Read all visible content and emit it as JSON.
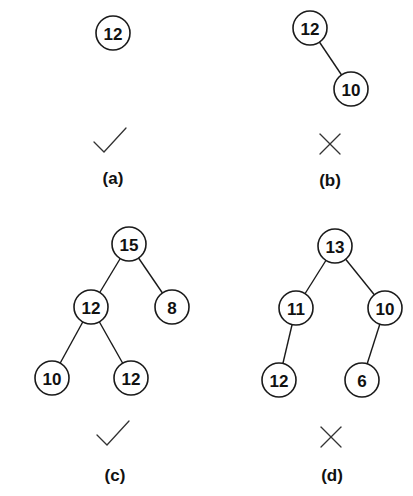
{
  "figure": {
    "node_radius": 17,
    "panels": [
      {
        "id": "a",
        "caption": "(a)",
        "caption_pos": [
          113,
          178
        ],
        "valid": true,
        "mark": "check-icon",
        "mark_pos": [
          110,
          140
        ],
        "nodes": [
          {
            "id": "a0",
            "label": "12",
            "x": 113,
            "y": 33
          }
        ],
        "edges": []
      },
      {
        "id": "b",
        "caption": "(b)",
        "caption_pos": [
          330,
          180
        ],
        "valid": false,
        "mark": "cross-icon",
        "mark_pos": [
          330,
          144
        ],
        "nodes": [
          {
            "id": "b0",
            "label": "12",
            "x": 310,
            "y": 28
          },
          {
            "id": "b1",
            "label": "10",
            "x": 351,
            "y": 89
          }
        ],
        "edges": [
          [
            "b0",
            "b1"
          ]
        ]
      },
      {
        "id": "c",
        "caption": "(c)",
        "caption_pos": [
          115,
          475
        ],
        "valid": true,
        "mark": "check-icon",
        "mark_pos": [
          113,
          433
        ],
        "nodes": [
          {
            "id": "c0",
            "label": "15",
            "x": 129,
            "y": 244
          },
          {
            "id": "c1",
            "label": "12",
            "x": 91,
            "y": 307
          },
          {
            "id": "c2",
            "label": "8",
            "x": 172,
            "y": 307
          },
          {
            "id": "c3",
            "label": "10",
            "x": 52,
            "y": 378
          },
          {
            "id": "c4",
            "label": "12",
            "x": 131,
            "y": 378
          }
        ],
        "edges": [
          [
            "c0",
            "c1"
          ],
          [
            "c0",
            "c2"
          ],
          [
            "c1",
            "c3"
          ],
          [
            "c1",
            "c4"
          ]
        ]
      },
      {
        "id": "d",
        "caption": "(d)",
        "caption_pos": [
          332,
          475
        ],
        "valid": false,
        "mark": "cross-icon",
        "mark_pos": [
          331,
          437
        ],
        "nodes": [
          {
            "id": "d0",
            "label": "13",
            "x": 335,
            "y": 246
          },
          {
            "id": "d1",
            "label": "11",
            "x": 296,
            "y": 308
          },
          {
            "id": "d2",
            "label": "10",
            "x": 385,
            "y": 308
          },
          {
            "id": "d3",
            "label": "12",
            "x": 279,
            "y": 380
          },
          {
            "id": "d4",
            "label": "6",
            "x": 362,
            "y": 380
          }
        ],
        "edges": [
          [
            "d0",
            "d1"
          ],
          [
            "d0",
            "d2"
          ],
          [
            "d1",
            "d3"
          ],
          [
            "d2",
            "d4"
          ]
        ]
      }
    ]
  }
}
